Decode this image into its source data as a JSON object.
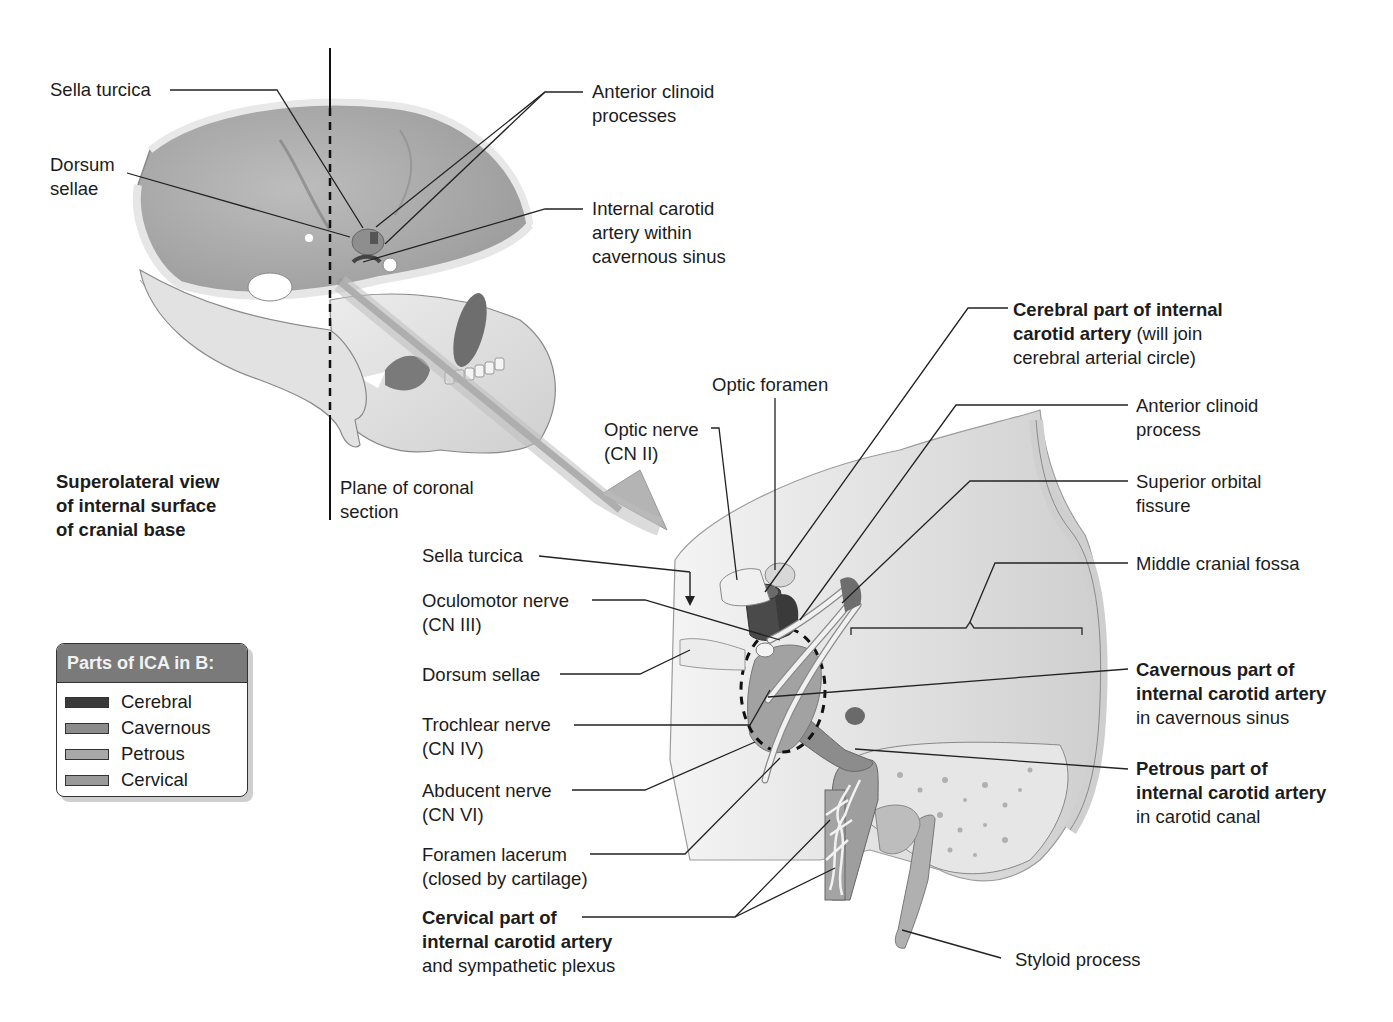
{
  "figure": {
    "panel_a": {
      "caption": [
        "Superolateral view",
        "of internal surface",
        "of cranial base"
      ],
      "labels": {
        "sella_turcica": "Sella turcica",
        "dorsum_sellae": [
          "Dorsum",
          "sellae"
        ],
        "anterior_clinoid_processes": [
          "Anterior clinoid",
          "processes"
        ],
        "ica_within_cavernous_sinus": [
          "Internal carotid",
          "artery within",
          "cavernous sinus"
        ],
        "plane_of_coronal_section": [
          "Plane of coronal",
          "section"
        ]
      }
    },
    "panel_b": {
      "labels": {
        "cerebral_part": {
          "bold_1": "Cerebral part of internal",
          "bold_2": "carotid artery",
          "normal_2": " (will join",
          "normal_3": "cerebral arterial circle)"
        },
        "optic_foramen": "Optic foramen",
        "optic_nerve": [
          "Optic nerve",
          "(CN II)"
        ],
        "anterior_clinoid_process": [
          "Anterior clinoid",
          "process"
        ],
        "superior_orbital_fissure": [
          "Superior orbital",
          "fissure"
        ],
        "middle_cranial_fossa": "Middle cranial fossa",
        "sella_turcica": "Sella turcica",
        "oculomotor_nerve": [
          "Oculomotor nerve",
          "(CN III)"
        ],
        "dorsum_sellae": "Dorsum sellae",
        "trochlear_nerve": [
          "Trochlear nerve",
          "(CN IV)"
        ],
        "abducent_nerve": [
          "Abducent nerve",
          "(CN VI)"
        ],
        "foramen_lacerum": [
          "Foramen lacerum",
          "(closed by cartilage)"
        ],
        "cavernous_part": {
          "bold_1": "Cavernous part of",
          "bold_2": "internal carotid artery",
          "normal_3": "in cavernous sinus"
        },
        "petrous_part": {
          "bold_1": "Petrous part of",
          "bold_2": "internal carotid artery",
          "normal_3": "in carotid canal"
        },
        "cervical_part": {
          "bold_1": "Cervical part of",
          "bold_2": "internal carotid artery",
          "normal_3": "and sympathetic plexus"
        },
        "styloid_process": "Styloid process"
      }
    },
    "legend": {
      "title": "Parts of ICA in B:",
      "items": [
        {
          "label": "Cerebral",
          "color": "#3a3a3a"
        },
        {
          "label": "Cavernous",
          "color": "#8c8c8c"
        },
        {
          "label": "Petrous",
          "color": "#a8a8a8"
        },
        {
          "label": "Cervical",
          "color": "#9a9a9a"
        }
      ]
    }
  }
}
